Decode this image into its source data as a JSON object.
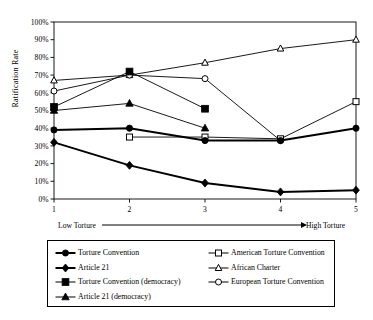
{
  "chart_data": {
    "type": "line",
    "title": "",
    "xlabel": "",
    "ylabel": "Ratification Rate",
    "x": [
      1,
      2,
      3,
      4,
      5
    ],
    "xticklabels": [
      "1",
      "2",
      "3",
      "4",
      "5"
    ],
    "yticklabels": [
      "0%",
      "10%",
      "20%",
      "30%",
      "40%",
      "50%",
      "60%",
      "70%",
      "80%",
      "90%",
      "100%"
    ],
    "ylim": [
      0,
      100
    ],
    "xlim": [
      1,
      5
    ],
    "grid": false,
    "legend_position": "below-plot",
    "axis_annotation_left": "Low Torture",
    "axis_annotation_right": "High Torture",
    "series": [
      {
        "name": "Torture Convention",
        "marker": "filled-circle",
        "line": "thick-solid",
        "x": [
          1,
          2,
          3,
          4,
          5
        ],
        "values": [
          39,
          40,
          33,
          33,
          40
        ]
      },
      {
        "name": "Article 21",
        "marker": "filled-diamond",
        "line": "thick-solid",
        "x": [
          1,
          2,
          3,
          4,
          5
        ],
        "values": [
          32,
          19,
          9,
          4,
          5
        ]
      },
      {
        "name": "Torture Convention (democracy)",
        "marker": "filled-square",
        "line": "thin-solid",
        "x": [
          1,
          2,
          3
        ],
        "values": [
          52,
          72,
          51
        ]
      },
      {
        "name": "Article 21 (democracy)",
        "marker": "filled-triangle",
        "line": "thin-solid",
        "x": [
          1,
          2,
          3
        ],
        "values": [
          50,
          54,
          40
        ]
      },
      {
        "name": "American Torture Convention",
        "marker": "open-square",
        "line": "thin-solid",
        "x": [
          2,
          3,
          4,
          5
        ],
        "values": [
          35,
          35,
          34,
          55
        ]
      },
      {
        "name": "African Charter",
        "marker": "open-triangle",
        "line": "thin-solid",
        "x": [
          1,
          2,
          3,
          4,
          5
        ],
        "values": [
          67,
          70,
          77,
          85,
          90
        ]
      },
      {
        "name": "European Torture Convention",
        "marker": "open-circle",
        "line": "thin-solid",
        "x": [
          1,
          2,
          3,
          4
        ],
        "values": [
          61,
          70,
          68,
          33
        ]
      }
    ]
  },
  "axis": {
    "ylabel": "Ratification Rate",
    "yticks": [
      "100%",
      "90%",
      "80%",
      "70%",
      "60%",
      "50%",
      "40%",
      "30%",
      "20%",
      "10%",
      "0%"
    ],
    "xticks": [
      "1",
      "2",
      "3",
      "4",
      "5"
    ],
    "low_label": "Low Torture",
    "high_label": "High Torture"
  },
  "legend": {
    "left_column": [
      {
        "label": "Torture Convention",
        "marker": "filled-circle"
      },
      {
        "label": "Article 21",
        "marker": "filled-diamond"
      },
      {
        "label": "Torture Convention (democracy)",
        "marker": "filled-square"
      },
      {
        "label": "Article 21 (democracy)",
        "marker": "filled-triangle"
      }
    ],
    "right_column": [
      {
        "label": "American Torture Convention",
        "marker": "open-square"
      },
      {
        "label": "African Charter",
        "marker": "open-triangle"
      },
      {
        "label": "European Torture Convention",
        "marker": "open-circle"
      }
    ]
  },
  "colors": {
    "ink": "#000000",
    "background": "#ffffff"
  }
}
